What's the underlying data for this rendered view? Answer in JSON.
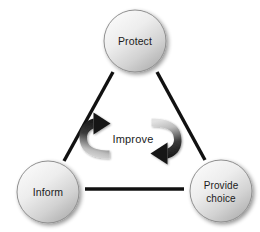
{
  "diagram": {
    "type": "cycle-triangle",
    "background_color": "#ffffff",
    "nodes": [
      {
        "id": "protect",
        "label": "Protect",
        "label_lines": [
          "Protect"
        ],
        "shape": "circle",
        "cx": 135,
        "cy": 41,
        "r": 31,
        "fill_light": "#f2f2f2",
        "fill_dark": "#b9b9b9",
        "stroke": "#8f8f8f"
      },
      {
        "id": "inform",
        "label": "Inform",
        "label_lines": [
          "Inform"
        ],
        "shape": "circle",
        "cx": 48,
        "cy": 192,
        "r": 31,
        "fill_light": "#f2f2f2",
        "fill_dark": "#b9b9b9",
        "stroke": "#8f8f8f"
      },
      {
        "id": "provide-choice",
        "label": "Provide choice",
        "label_lines": [
          "Provide",
          "choice"
        ],
        "shape": "circle",
        "cx": 221,
        "cy": 191,
        "r": 31,
        "fill_light": "#f2f2f2",
        "fill_dark": "#b9b9b9",
        "stroke": "#8f8f8f"
      }
    ],
    "connectors": [
      {
        "id": "protect-to-inform",
        "from": "protect",
        "to": "inform",
        "style": "line",
        "color": "#111111",
        "width": 3.4
      },
      {
        "id": "protect-to-provide-choice",
        "from": "protect",
        "to": "provide-choice",
        "style": "line",
        "color": "#111111",
        "width": 3.4
      },
      {
        "id": "inform-to-provide-choice",
        "from": "inform",
        "to": "provide-choice",
        "style": "line",
        "color": "#111111",
        "width": 3.4
      }
    ],
    "center": {
      "label": "Improve",
      "arrows": [
        {
          "id": "left-cycle-arrow",
          "direction": "clockwise-up",
          "head": "top-right",
          "gradient_from": "#1a1a1a",
          "gradient_to": "#d8d8d8"
        },
        {
          "id": "right-cycle-arrow",
          "direction": "clockwise-down",
          "head": "bottom-left",
          "gradient_from": "#d8d8d8",
          "gradient_to": "#1a1a1a"
        }
      ]
    }
  }
}
